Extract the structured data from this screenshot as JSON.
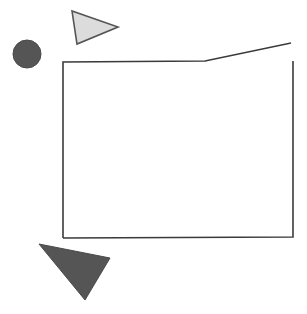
{
  "canvas": {
    "width": 307,
    "height": 314,
    "background": "#ffffff",
    "title": "Geometric Shapes Figure"
  },
  "palette": {
    "dark_fill": "#555555",
    "light_fill": "#dcdcdc",
    "outline": "#333333",
    "background": "#ffffff"
  },
  "shapes": [
    {
      "id": "circle",
      "name": "dark-circle",
      "type": "circle",
      "cx": 27,
      "cy": 54,
      "r": 14,
      "fill": "#555555",
      "stroke": "#4a4a4a",
      "stroke_width": 1,
      "label": "Filled dark gray circle"
    },
    {
      "id": "light-triangle",
      "name": "light-triangle",
      "type": "polygon",
      "points": "72,11 77,44 118,27",
      "fill": "#dcdcdc",
      "stroke": "#555555",
      "stroke_width": 1.6,
      "label": "Light gray right-pointing triangle"
    },
    {
      "id": "open-polygon",
      "name": "open-polygon-outline",
      "type": "polyline",
      "points": "63,238 63,62 205,61 291,43",
      "fill": "none",
      "stroke": "#3b3b3b",
      "stroke_width": 1.6,
      "label": "Open polyline forming left side and kinked top edge"
    },
    {
      "id": "polygon-bottom-right",
      "name": "polygon-right-and-bottom-edge",
      "type": "polyline",
      "points": "293,61 293,237 63,238",
      "fill": "none",
      "stroke": "#3b3b3b",
      "stroke_width": 1.6,
      "label": "Right vertical edge and bottom edge of outlined shape"
    },
    {
      "id": "dark-triangle",
      "name": "dark-triangle",
      "type": "polygon",
      "points": "39,244 110,258 85,300",
      "fill": "#555555",
      "stroke": "#4a4a4a",
      "stroke_width": 1,
      "label": "Filled dark gray downward triangle"
    }
  ]
}
